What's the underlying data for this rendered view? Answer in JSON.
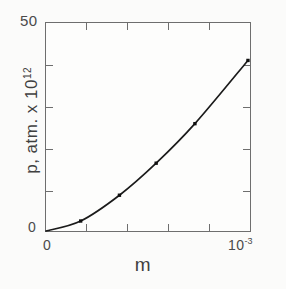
{
  "figure": {
    "background_color": "#fbfbfa",
    "axis_color": "#6e6e6e",
    "curve_color": "#1b1b1b",
    "marker_color": "#101010"
  },
  "axes": {
    "y": {
      "title_main": "p, atm. x 10",
      "title_exponent": "12",
      "tick_label_max": "50",
      "tick_label_min": "0"
    },
    "x": {
      "title": "m",
      "tick_label_min": "0",
      "tick_label_max_mantissa": "10",
      "tick_label_max_exponent": "-3"
    }
  },
  "chart_data": {
    "type": "line",
    "title": "",
    "subtitle": "",
    "xlabel": "m",
    "ylabel": "p, atm. x 10^12",
    "xlim": [
      0,
      0.001
    ],
    "ylim": [
      0,
      50
    ],
    "xticks": [
      0,
      0.001
    ],
    "xtick_labels": [
      "0",
      "10^-3"
    ],
    "yticks": [
      0,
      50
    ],
    "ytick_labels": [
      "0",
      "50"
    ],
    "x_minor_tick_count": 4,
    "y_minor_tick_count": 4,
    "grid": false,
    "legend": null,
    "annotations": [],
    "series": [
      {
        "name": "p vs m",
        "marker": "dot",
        "line": "solid",
        "x": [
          0.0,
          0.00017,
          0.00036,
          0.00054,
          0.00073,
          0.00099
        ],
        "y": [
          0.0,
          2.4,
          8.6,
          16.3,
          25.8,
          41.0
        ],
        "x_units": "molality (m)",
        "y_units": "atm x 10^12"
      }
    ],
    "curve_description": "Smooth upward-concave (approximately quadratic) curve rising from the origin to the upper-right corner of the plot box."
  }
}
